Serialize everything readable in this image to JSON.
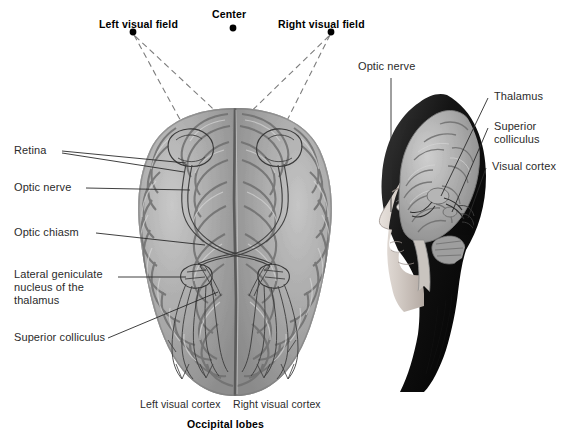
{
  "figure": {
    "background_color": "#ffffff",
    "text_color": "#2b2b2b",
    "bold_text_color": "#000000",
    "leader_line_color": "#2a2a2a",
    "dashed_ray_color": "#7d7d7d"
  },
  "top_labels": {
    "left_visual_field": "Left visual field",
    "center": "Center",
    "right_visual_field": "Right visual field"
  },
  "left_labels": {
    "retina": "Retina",
    "optic_nerve": "Optic nerve",
    "optic_chiasm": "Optic chiasm",
    "lateral_geniculate": "Lateral geniculate nucleus of the thalamus",
    "superior_colliculus": "Superior colliculus"
  },
  "bottom_labels": {
    "left_visual_cortex": "Left visual cortex",
    "right_visual_cortex": "Right visual cortex",
    "occipital_lobes": "Occipital lobes"
  },
  "head_inset_labels": {
    "optic_nerve": "Optic nerve",
    "thalamus": "Thalamus",
    "superior_colliculus": "Superior colliculus",
    "visual_cortex": "Visual cortex"
  },
  "markers": {
    "left_field_dot": {
      "x": 133,
      "y": 32
    },
    "center_dot": {
      "x": 233,
      "y": 28
    },
    "right_field_dot": {
      "x": 331,
      "y": 32
    }
  }
}
